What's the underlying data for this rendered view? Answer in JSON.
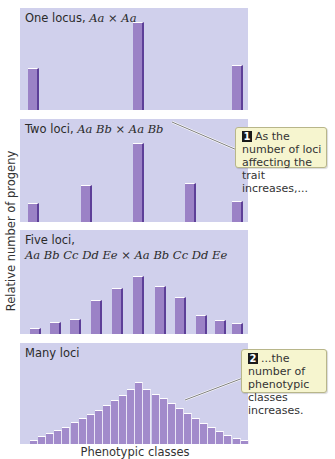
{
  "figure": {
    "y_axis_label": "Relative number of progeny",
    "x_axis_label": "Phenotypic classes",
    "colors": {
      "panel_bg": "#d0d0ec",
      "bar_fill": "#9b82c6",
      "bar_shadow": "#5d3f98",
      "callout_bg": "#f6f5cf",
      "callout_border": "#b8b68a"
    },
    "panels": [
      {
        "title_plain": "One locus, ",
        "title_italic": "Aa × Aa",
        "top": 8,
        "height": 102
      },
      {
        "title_plain": "Two loci, ",
        "title_italic": "Aa Bb × Aa Bb",
        "top": 119,
        "height": 103
      },
      {
        "title_plain": "Five loci,",
        "title_italic": "Aa Bb Cc Dd Ee × Aa Bb Cc Dd Ee",
        "top": 230,
        "height": 104
      },
      {
        "title_plain": "Many loci",
        "title_italic": "",
        "top": 343,
        "height": 101
      }
    ],
    "callouts": [
      {
        "number": "1",
        "text": "As the number of loci affecting the trait increases,...",
        "left": 235,
        "top": 127,
        "width": 92,
        "height": 41
      },
      {
        "number": "2",
        "text": "...the number of phenotypic classes increases.",
        "left": 241,
        "top": 349,
        "width": 86,
        "height": 44
      }
    ]
  },
  "chart_data": [
    {
      "type": "bar",
      "title": "One locus, Aa × Aa",
      "xlabel": "Phenotypic classes",
      "ylabel": "Relative number of progeny",
      "categories": [
        "1",
        "2",
        "3"
      ],
      "values": [
        1,
        2,
        1
      ],
      "bar_x": [
        28,
        133,
        232
      ],
      "bar_height_px": [
        42,
        88,
        45
      ]
    },
    {
      "type": "bar",
      "title": "Two loci, Aa Bb × Aa Bb",
      "xlabel": "Phenotypic classes",
      "ylabel": "Relative number of progeny",
      "categories": [
        "1",
        "2",
        "3",
        "4",
        "5"
      ],
      "values": [
        1,
        4,
        6,
        4,
        1
      ],
      "bar_x": [
        28,
        81,
        133,
        185,
        232
      ],
      "bar_height_px": [
        19,
        37,
        79,
        39,
        21
      ]
    },
    {
      "type": "bar",
      "title": "Five loci, Aa Bb Cc Dd Ee × Aa Bb Cc Dd Ee",
      "xlabel": "Phenotypic classes",
      "ylabel": "Relative number of progeny",
      "categories": [
        "1",
        "2",
        "3",
        "4",
        "5",
        "6",
        "7",
        "8",
        "9",
        "10",
        "11"
      ],
      "values": [
        1,
        10,
        45,
        120,
        210,
        252,
        210,
        120,
        45,
        10,
        1
      ],
      "bar_x": [
        30,
        50,
        70,
        91,
        112,
        133,
        155,
        175,
        196,
        215,
        232
      ],
      "bar_height_px": [
        6,
        12,
        15,
        34,
        46,
        58,
        48,
        37,
        19,
        14,
        11
      ]
    },
    {
      "type": "bar",
      "title": "Many loci",
      "xlabel": "Phenotypic classes",
      "ylabel": "Relative number of progeny",
      "categories": [
        "1",
        "2",
        "3",
        "4",
        "5",
        "6",
        "7",
        "8",
        "9",
        "10",
        "11",
        "12",
        "13",
        "14",
        "15",
        "16",
        "17",
        "18",
        "19",
        "20",
        "21",
        "22",
        "23",
        "24",
        "25",
        "26",
        "27"
      ],
      "bar_x_start": 30,
      "bar_width": 8.1,
      "bar_height_px": [
        4,
        8,
        11,
        14,
        17,
        22,
        26,
        30,
        34,
        39,
        44,
        49,
        55,
        62,
        55,
        50,
        46,
        41,
        36,
        31,
        26,
        21,
        17,
        13,
        9,
        6,
        4
      ],
      "shape": "approximately normal distribution"
    }
  ]
}
